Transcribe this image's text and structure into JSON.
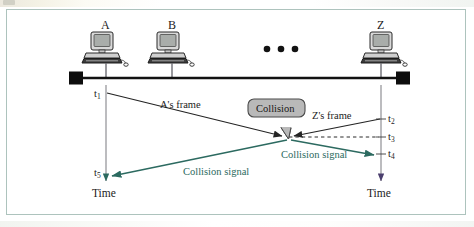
{
  "diagram": {
    "colors": {
      "bus_line": "#111111",
      "frame_arrow": "#242424",
      "collision_signal": "#2c6a60",
      "lifeline": "#8f8f94",
      "callout_fill": "#b9b9b9",
      "callout_border": "#4a4a4a",
      "page_border": "#adc3bd"
    },
    "stations": [
      {
        "id": "station-a",
        "label": "A",
        "icon": "desktop-computer-icon"
      },
      {
        "id": "station-b",
        "label": "B",
        "icon": "desktop-computer-icon"
      },
      {
        "id": "station-z",
        "label": "Z",
        "icon": "desktop-computer-icon"
      }
    ],
    "ellipsis": "•  •  •",
    "bus": {
      "terminator_left": "bus-terminator-left",
      "terminator_right": "bus-terminator-right"
    },
    "time_marks": [
      {
        "id": "t1",
        "label": "t",
        "sub": "1",
        "side": "left"
      },
      {
        "id": "t5",
        "label": "t",
        "sub": "5",
        "side": "left"
      },
      {
        "id": "t2",
        "label": "t",
        "sub": "2",
        "side": "right"
      },
      {
        "id": "t3",
        "label": "t",
        "sub": "3",
        "side": "right"
      },
      {
        "id": "t4",
        "label": "t",
        "sub": "4",
        "side": "right"
      }
    ],
    "axis_labels": {
      "left": "Time",
      "right": "Time"
    },
    "annotations": {
      "a_frame": "A's frame",
      "z_frame": "Z's frame",
      "collision_callout": "Collision",
      "collision_signal_left": "Collision signal",
      "collision_signal_right": "Collision signal"
    }
  }
}
